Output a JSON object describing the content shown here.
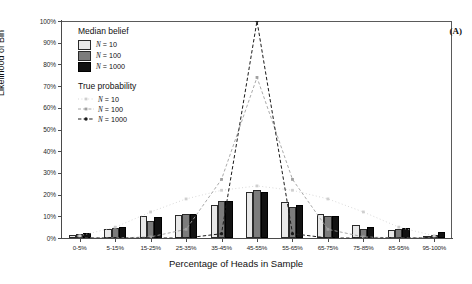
{
  "panel_label": "(A)",
  "chart_data": {
    "type": "bar",
    "title": "",
    "xlabel": "Percentage of Heads in Sample",
    "ylabel": "Likelihood of Bin",
    "ylim": [
      0,
      100
    ],
    "ytick_labels": [
      "0%",
      "10%",
      "20%",
      "30%",
      "40%",
      "50%",
      "60%",
      "70%",
      "80%",
      "90%",
      "100%"
    ],
    "ytick_values": [
      0,
      10,
      20,
      30,
      40,
      50,
      60,
      70,
      80,
      90,
      100
    ],
    "grid": false,
    "legend_position": "upper-left-inside",
    "categories": [
      "0-5%",
      "5-15%",
      "15-25%",
      "25-35%",
      "35-45%",
      "45-55%",
      "55-65%",
      "65-75%",
      "75-85%",
      "85-95%",
      "95-100%"
    ],
    "series": [
      {
        "name": "Median belief N = 10",
        "key": "median_N10",
        "color": "#e8e8e8",
        "values": [
          1.5,
          4.0,
          10.0,
          10.5,
          15.0,
          21.0,
          16.5,
          11.0,
          6.0,
          3.5,
          1.0
        ]
      },
      {
        "name": "Median belief N = 100",
        "key": "median_N100",
        "color": "#7c7c7c",
        "values": [
          2.0,
          4.5,
          8.0,
          11.0,
          17.0,
          22.0,
          14.5,
          10.0,
          4.0,
          4.0,
          1.5
        ]
      },
      {
        "name": "Median belief N = 1000",
        "key": "median_N1000",
        "color": "#121212",
        "values": [
          2.5,
          5.0,
          9.5,
          11.0,
          17.0,
          21.0,
          15.0,
          10.0,
          5.0,
          4.5,
          3.0
        ]
      }
    ],
    "overlay_series": [
      {
        "name": "True probability N = 10",
        "key": "true_N10",
        "style": "dotted-light",
        "color": "#c9c9c9",
        "values": [
          1.0,
          5.0,
          12.0,
          18.0,
          22.0,
          24.0,
          22.0,
          18.0,
          12.0,
          5.0,
          1.0
        ]
      },
      {
        "name": "True probability N = 100",
        "key": "true_N100",
        "style": "dashed-gray",
        "color": "#9a9a9a",
        "values": [
          0.0,
          0.0,
          0.5,
          4.0,
          27.0,
          74.0,
          27.0,
          4.0,
          0.5,
          0.0,
          0.0
        ]
      },
      {
        "name": "True probability N = 1000",
        "key": "true_N1000",
        "style": "dashed-black",
        "color": "#1a1a1a",
        "values": [
          0.0,
          0.0,
          0.0,
          0.0,
          2.0,
          100.0,
          2.0,
          0.0,
          0.0,
          0.0,
          0.0
        ]
      }
    ]
  },
  "legend": {
    "group1_title": "Median belief",
    "group2_title": "True probability",
    "items1": [
      {
        "label_n": "N",
        "label_eq": " = 10",
        "swatch": "s0"
      },
      {
        "label_n": "N",
        "label_eq": " = 100",
        "swatch": "s1"
      },
      {
        "label_n": "N",
        "label_eq": " = 1000",
        "swatch": "s2"
      }
    ],
    "items2": [
      {
        "label_n": "N",
        "label_eq": " = 10",
        "key": "dotted-light"
      },
      {
        "label_n": "N",
        "label_eq": " = 100",
        "key": "dashed-gray"
      },
      {
        "label_n": "N",
        "label_eq": " = 1000",
        "key": "dashed-black"
      }
    ]
  }
}
